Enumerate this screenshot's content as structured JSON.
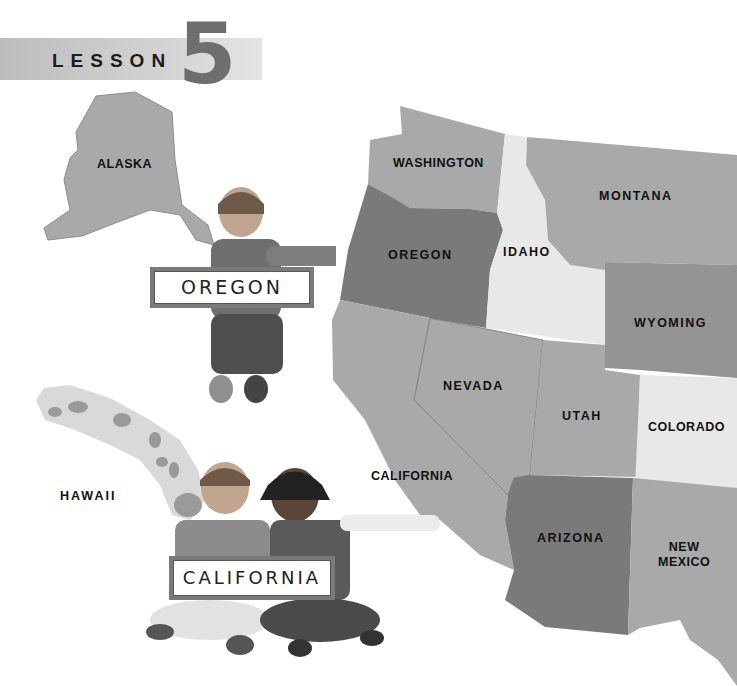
{
  "header": {
    "lesson_word": "LESSON",
    "lesson_number": "5"
  },
  "map": {
    "states": {
      "alaska": "ALASKA",
      "hawaii": "HAWAII",
      "washington": "WASHINGTON",
      "oregon": "OREGON",
      "idaho": "IDAHO",
      "montana": "MONTANA",
      "wyoming": "WYOMING",
      "nevada": "NEVADA",
      "utah": "UTAH",
      "colorado": "COLORADO",
      "california": "CALIFORNIA",
      "arizona": "ARIZONA",
      "new_mexico_line1": "NEW",
      "new_mexico_line2": "MEXICO"
    },
    "colors": {
      "light": "#e8e8e8",
      "medium": "#a9a9a9",
      "mid_dark": "#949494",
      "dark": "#7a7a7a"
    }
  },
  "signs": {
    "oregon_sign": "OREGON",
    "california_sign": "CALIFORNIA"
  }
}
